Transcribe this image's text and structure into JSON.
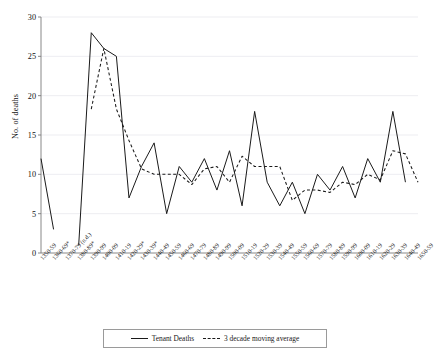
{
  "chart_data": {
    "type": "line",
    "title": "",
    "xlabel": "",
    "ylabel": "No. of deaths",
    "ylim": [
      0,
      30
    ],
    "yticks": [
      0,
      5,
      10,
      15,
      20,
      25,
      30
    ],
    "grid": true,
    "legend_position": "bottom",
    "categories": [
      "1350-59",
      "1360-69*",
      "1370-79 (n.d.)",
      "1380-89*",
      "1390-99",
      "1400-09",
      "1410-19",
      "1420-29*",
      "1430-39*",
      "1440-49",
      "1450-59",
      "1460-69",
      "1470-79",
      "1480-89",
      "1490-99",
      "1500-09",
      "1510-19",
      "1520-29",
      "1530-39",
      "1540-49",
      "1550-59",
      "1560-69",
      "1570-79",
      "1580-89",
      "1590-99",
      "1600-09",
      "1610-19",
      "1620-29",
      "1630-39",
      "1640-49",
      "1650-59"
    ],
    "series": [
      {
        "name": "Tenant Deaths",
        "style": "solid",
        "values": [
          12,
          3,
          null,
          1,
          28,
          26,
          25,
          7,
          11,
          14,
          5,
          11,
          9,
          12,
          8,
          13,
          6,
          18,
          9,
          6,
          9,
          5,
          10,
          8,
          11,
          7,
          12,
          9,
          18,
          9,
          null
        ]
      },
      {
        "name": "3 decade moving average",
        "style": "dashed",
        "values": [
          null,
          null,
          null,
          null,
          18.3,
          26,
          18.3,
          14.3,
          10.7,
          10,
          10,
          10,
          8.7,
          10.7,
          11,
          9,
          12.3,
          11,
          11,
          11,
          6.7,
          8,
          8,
          7.7,
          9,
          8.7,
          10,
          9.3,
          13,
          12.6,
          9
        ]
      }
    ],
    "legend": [
      {
        "label": "Tenant Deaths",
        "style": "solid"
      },
      {
        "label": "3 decade moving average",
        "style": "dashed"
      }
    ]
  }
}
